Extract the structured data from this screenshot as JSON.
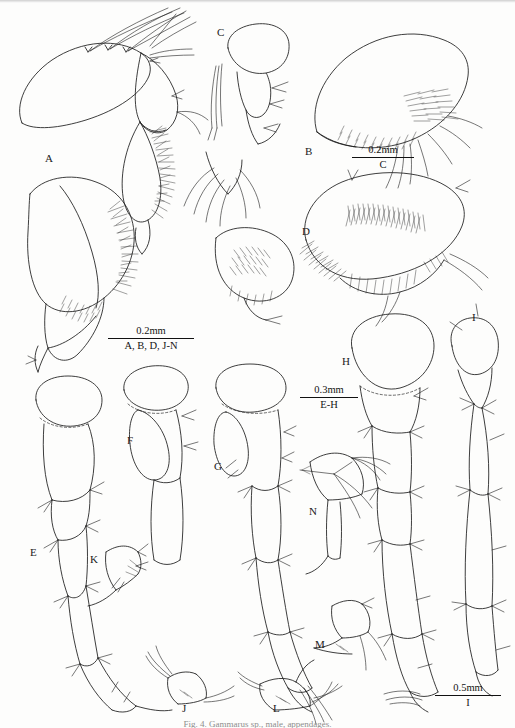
{
  "figure": {
    "kind": "scientific-illustration-plate",
    "background_color": "#fdfdfc",
    "ink_color": "#1b1b1b",
    "caption": "Fig. 4.  Gammarus sp., male, appendages."
  },
  "panel_labels": [
    {
      "id": "A",
      "x": 45,
      "y": 152
    },
    {
      "id": "B",
      "x": 305,
      "y": 145
    },
    {
      "id": "C",
      "x": 217,
      "y": 26
    },
    {
      "id": "D",
      "x": 302,
      "y": 225
    },
    {
      "id": "E",
      "x": 30,
      "y": 546
    },
    {
      "id": "F",
      "x": 127,
      "y": 434
    },
    {
      "id": "G",
      "x": 214,
      "y": 460
    },
    {
      "id": "H",
      "x": 342,
      "y": 355
    },
    {
      "id": "I",
      "x": 472,
      "y": 311
    },
    {
      "id": "J",
      "x": 182,
      "y": 702
    },
    {
      "id": "K",
      "x": 90,
      "y": 553
    },
    {
      "id": "L",
      "x": 273,
      "y": 702
    },
    {
      "id": "M",
      "x": 315,
      "y": 638
    },
    {
      "id": "N",
      "x": 309,
      "y": 505
    }
  ],
  "scale_bars": [
    {
      "name": "scale-bar-c",
      "value": "0.2mm",
      "ids": "C",
      "x": 352,
      "y": 144,
      "width": 62
    },
    {
      "name": "scale-bar-abdjn",
      "value": "0.2mm",
      "ids": "A, B, D, J-N",
      "x": 108,
      "y": 325,
      "width": 86
    },
    {
      "name": "scale-bar-eh",
      "value": "0.3mm",
      "ids": "E-H",
      "x": 300,
      "y": 384,
      "width": 58
    },
    {
      "name": "scale-bar-i",
      "value": "0.5mm",
      "ids": "I",
      "x": 435,
      "y": 682,
      "width": 66
    }
  ]
}
